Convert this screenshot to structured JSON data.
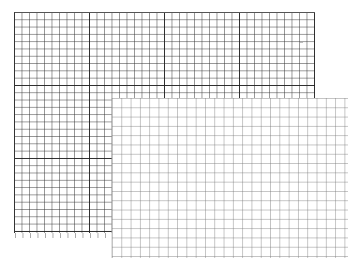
{
  "scene": {
    "description": "Two sheets of graph paper, one overlapping the other",
    "sheets": [
      {
        "id": "dark-grid",
        "style": "dark lines with major lines every 10 cells",
        "minor_cell_px": 7.5,
        "major_every": 10
      },
      {
        "id": "light-grid",
        "style": "light gray uniform grid",
        "minor_cell_px": 9.3
      }
    ],
    "colors": {
      "background": "#ffffff",
      "dark_lines": "#1e1e1e",
      "light_lines": "#9a9a9a"
    }
  }
}
